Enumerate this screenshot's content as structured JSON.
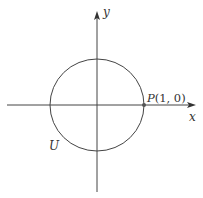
{
  "figure": {
    "colors": {
      "stroke": "#444444",
      "point": "#555555",
      "text": "#333333",
      "background": "#ffffff"
    },
    "axes": {
      "x_label": "x",
      "y_label": "y",
      "origin_px": [
        97,
        105
      ]
    },
    "circle": {
      "label": "U",
      "center_px": [
        97,
        105
      ],
      "radius_px": 47
    },
    "point": {
      "name": "P",
      "coords_text": "(1, 0)",
      "label": "P(1, 0)",
      "px": [
        144,
        105
      ]
    }
  }
}
